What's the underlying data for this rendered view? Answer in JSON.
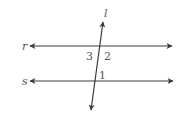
{
  "diagram": {
    "type": "parallel-lines-transversal",
    "line_color": "#3a3a3a",
    "label_color": "#555555",
    "lines": [
      {
        "name": "r",
        "label": "r",
        "x1": 30,
        "y1": 46,
        "x2": 172,
        "y2": 46
      },
      {
        "name": "s",
        "label": "s",
        "x1": 30,
        "y1": 81,
        "x2": 173,
        "y2": 81
      },
      {
        "name": "l",
        "label": "l",
        "x1": 103,
        "y1": 22,
        "x2": 91,
        "y2": 110
      }
    ],
    "angles": [
      {
        "label": "3",
        "x": 86,
        "y": 60
      },
      {
        "label": "2",
        "x": 104,
        "y": 60
      },
      {
        "label": "1",
        "x": 99,
        "y": 79
      }
    ],
    "line_labels": {
      "r": {
        "text": "r",
        "x": 22,
        "y": 50
      },
      "s": {
        "text": "s",
        "x": 22,
        "y": 85
      },
      "l": {
        "text": "l",
        "x": 104,
        "y": 17
      }
    }
  }
}
